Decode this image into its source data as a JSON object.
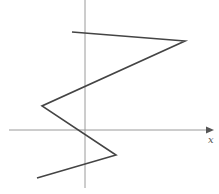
{
  "diagram": {
    "type": "piecewise-linear-graph",
    "axes": {
      "x_label": "x",
      "y_label": "",
      "origin_px": [
        85,
        130
      ],
      "x_axis_px": {
        "from": 9,
        "to": 214,
        "y": 130
      },
      "y_axis_px": {
        "x": 85,
        "from": 0,
        "to": 188
      },
      "color": "#9a9a9a"
    },
    "graph": {
      "color": "#444444",
      "points_px": [
        [
          72,
          32
        ],
        [
          185,
          41
        ],
        [
          42,
          106
        ],
        [
          116,
          155
        ],
        [
          37,
          178
        ]
      ]
    }
  }
}
